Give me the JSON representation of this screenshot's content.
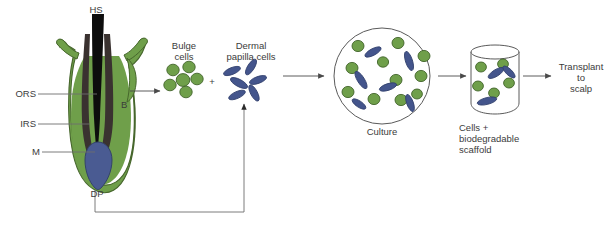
{
  "figure": {
    "title": "",
    "type": "process-flow-diagram",
    "background": "#ffffff"
  },
  "colors": {
    "follicle_green": "#6f9f4a",
    "follicle_green_dark": "#46662c",
    "hair_shaft_black": "#0d0d0d",
    "sheath_dark": "#3a3230",
    "dermal_papilla_blue": "#4a5b92",
    "dermal_papilla_blue_dark": "#334269",
    "bulge_cell_green": "#6f9f4a",
    "bulge_cell_green_dark": "#42642a",
    "dp_cell_blue": "#44558c",
    "dp_cell_blue_dark": "#2f3e6b",
    "line_gray": "#6d6d6d",
    "text_gray": "#3b3b3b",
    "vessel_outline": "#5a5a5a"
  },
  "follicle": {
    "labels": {
      "hair_shaft": "HS",
      "outer_root_sheath": "ORS",
      "inner_root_sheath": "IRS",
      "matrix": "M",
      "bulge": "B",
      "dermal_papilla": "DP"
    }
  },
  "stages": {
    "bulge_cells": {
      "label_line1": "Bulge",
      "label_line2": "cells",
      "cell_count": 6,
      "cell_shape": "round",
      "cell_color": "#6f9f4a"
    },
    "plus_sign": "+",
    "dermal_papilla_cells": {
      "label_line1": "Dermal",
      "label_line2": "papilla cells",
      "cell_count": 6,
      "cell_shape": "spindle",
      "cell_color": "#44558c"
    },
    "culture": {
      "label": "Culture",
      "vessel": "petri-dish",
      "green_cell_count": 11,
      "blue_cell_count": 6
    },
    "scaffold": {
      "label_line1": "Cells +",
      "label_line2": "biodegradable",
      "label_line3": "scaffold",
      "vessel": "cylinder",
      "green_cell_count": 5,
      "blue_cell_count": 3
    },
    "transplant": {
      "label_line1": "Transplant",
      "label_line2": "to",
      "label_line3": "scalp"
    }
  },
  "flow": {
    "arrow_count": 4,
    "feedback_arrow": "dermal-papilla-to-dermal-papilla-cells"
  }
}
